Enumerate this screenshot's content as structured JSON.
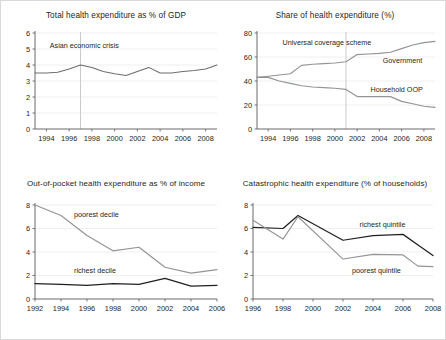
{
  "figure": {
    "background": "#ffffff",
    "border_color": "#d9d9d9",
    "accent_dark": "#231f20",
    "accent_gray": "#929497"
  },
  "chart_data": [
    {
      "id": "total-health-expenditure",
      "type": "line",
      "title": "Total health expenditure as % of GDP",
      "xlabel": "",
      "ylabel": "",
      "xlim": [
        1993,
        2009
      ],
      "ylim": [
        0,
        6
      ],
      "yticks": [
        0,
        1,
        2,
        3,
        4,
        5,
        6
      ],
      "ytick_labels": [
        "0",
        "1",
        "2",
        "3",
        "4",
        "5",
        "6"
      ],
      "xticks": [
        1994,
        1996,
        1998,
        2000,
        2002,
        2004,
        2006,
        2008
      ],
      "xtick_labels": [
        "1994",
        "1996",
        "1998",
        "2000",
        "2002",
        "2004",
        "2006",
        "2008"
      ],
      "grid": "horizontal",
      "legend": "none",
      "annotations": [
        {
          "text": "Asian economic crisis",
          "x": 1994.3,
          "y": 5.05,
          "anchor": "start"
        }
      ],
      "event_lines": [
        {
          "x": 1997,
          "label": "Asian economic crisis"
        }
      ],
      "x": [
        1993,
        1994,
        1995,
        1996,
        1997,
        1998,
        1999,
        2000,
        2001,
        2002,
        2003,
        2004,
        2005,
        2006,
        2007,
        2008,
        2009
      ],
      "series": [
        {
          "name": "Total health expenditure as % of GDP",
          "color": "#6d6e71",
          "values": [
            3.5,
            3.5,
            3.55,
            3.75,
            4.0,
            3.85,
            3.6,
            3.45,
            3.35,
            3.6,
            3.85,
            3.5,
            3.5,
            3.6,
            3.65,
            3.75,
            4.0
          ]
        }
      ]
    },
    {
      "id": "share-health-expenditure",
      "type": "line",
      "title": "Share of health expenditure (%)",
      "xlabel": "",
      "ylabel": "",
      "xlim": [
        1993,
        2009
      ],
      "ylim": [
        0,
        80
      ],
      "yticks": [
        0,
        20,
        40,
        60,
        80
      ],
      "ytick_labels": [
        "0",
        "20",
        "40",
        "60",
        "80"
      ],
      "xticks": [
        1994,
        1996,
        1998,
        2000,
        2002,
        2004,
        2006,
        2008
      ],
      "xtick_labels": [
        "1994",
        "1996",
        "1998",
        "2000",
        "2002",
        "2004",
        "2006",
        "2008"
      ],
      "grid": "horizontal",
      "legend": "inline-labels",
      "annotations": [
        {
          "text": "Universal coverage scheme",
          "x": 1995.3,
          "y": 70,
          "anchor": "start"
        },
        {
          "text": "Government",
          "x": 2004.3,
          "y": 55,
          "anchor": "start"
        },
        {
          "text": "Household OOP",
          "x": 2003.2,
          "y": 31,
          "anchor": "start"
        }
      ],
      "event_lines": [
        {
          "x": 2001,
          "label": "Universal coverage scheme"
        }
      ],
      "x": [
        1993,
        1994,
        1995,
        1996,
        1997,
        1998,
        1999,
        2000,
        2001,
        2002,
        2003,
        2004,
        2005,
        2006,
        2007,
        2008,
        2009
      ],
      "series": [
        {
          "name": "Government",
          "color": "#929497",
          "values": [
            43,
            44,
            45,
            46,
            53,
            54,
            54.5,
            55,
            56,
            62,
            62.5,
            63,
            64,
            67,
            70,
            72,
            73
          ]
        },
        {
          "name": "Household OOP",
          "color": "#929497",
          "values": [
            43,
            43,
            40,
            38,
            36,
            35,
            34.5,
            34,
            33,
            27,
            27,
            27,
            27,
            23,
            21,
            19,
            18
          ]
        }
      ]
    },
    {
      "id": "out-of-pocket-share-income",
      "type": "line",
      "title": "Out-of-pocket health expenditure as % of income",
      "xlabel": "",
      "ylabel": "",
      "xlim": [
        1992,
        2006
      ],
      "ylim": [
        0,
        8
      ],
      "yticks": [
        0,
        2,
        4,
        6,
        8
      ],
      "ytick_labels": [
        "0",
        "2",
        "4",
        "6",
        "8"
      ],
      "xticks": [
        1992,
        1994,
        1996,
        1998,
        2000,
        2002,
        2004,
        2006
      ],
      "xtick_labels": [
        "1992",
        "1994",
        "1996",
        "1998",
        "2000",
        "2002",
        "2004",
        "2006"
      ],
      "grid": "horizontal",
      "legend": "inline-labels",
      "annotations": [
        {
          "text": "poorest decile",
          "x": 1995.0,
          "y": 7.0,
          "anchor": "start"
        },
        {
          "text": "richest decile",
          "x": 1995.0,
          "y": 2.2,
          "anchor": "start"
        }
      ],
      "event_lines": [],
      "x": [
        1992,
        1994,
        1996,
        1998,
        2000,
        2002,
        2004,
        2006
      ],
      "series": [
        {
          "name": "poorest decile",
          "color": "#929497",
          "values": [
            8.0,
            7.1,
            5.4,
            4.1,
            4.4,
            2.7,
            2.2,
            2.5
          ]
        },
        {
          "name": "richest decile",
          "color": "#231f20",
          "values": [
            1.3,
            1.25,
            1.15,
            1.3,
            1.25,
            1.75,
            1.1,
            1.15
          ]
        }
      ]
    },
    {
      "id": "catastrophic-health-expenditure",
      "type": "line",
      "title": "Catastrophic health expenditure (% of households)",
      "xlabel": "",
      "ylabel": "",
      "xlim": [
        1996,
        2008
      ],
      "ylim": [
        0,
        8
      ],
      "yticks": [
        0,
        2,
        4,
        6,
        8
      ],
      "ytick_labels": [
        "0",
        "2",
        "4",
        "6",
        "8"
      ],
      "xticks": [
        1996,
        1998,
        2000,
        2002,
        2004,
        2006,
        2008
      ],
      "xtick_labels": [
        "1996",
        "1998",
        "2000",
        "2002",
        "2004",
        "2006",
        "2008"
      ],
      "grid": "horizontal",
      "legend": "inline-labels",
      "annotations": [
        {
          "text": "richest quintile",
          "x": 2003.1,
          "y": 6.1,
          "anchor": "start"
        },
        {
          "text": "poorest quintile",
          "x": 2002.6,
          "y": 2.2,
          "anchor": "start"
        }
      ],
      "event_lines": [],
      "x": [
        1996,
        1998,
        1999,
        2002,
        2004,
        2006,
        2007,
        2008
      ],
      "series": [
        {
          "name": "richest quintile",
          "color": "#231f20",
          "values": [
            6.1,
            6.0,
            7.1,
            5.0,
            5.4,
            5.5,
            4.6,
            3.7
          ]
        },
        {
          "name": "poorest quintile",
          "color": "#929497",
          "values": [
            6.7,
            5.1,
            7.0,
            3.4,
            3.8,
            3.75,
            2.8,
            2.75
          ]
        }
      ]
    }
  ]
}
